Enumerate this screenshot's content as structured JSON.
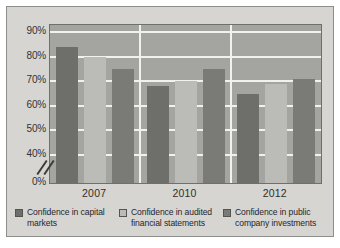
{
  "chart_data": {
    "type": "bar",
    "title": "",
    "xlabel": "",
    "ylabel": "",
    "categories": [
      "2007",
      "2010",
      "2012"
    ],
    "series": [
      {
        "name": "Confidence in capital markets",
        "color": "#6e6e6b",
        "values": [
          84,
          68,
          65
        ]
      },
      {
        "name": "Confidence in audited financial statements",
        "color": "#bbbbb7",
        "values": [
          80,
          70,
          69
        ]
      },
      {
        "name": "Confidence in public company investments",
        "color": "#7a7a77",
        "values": [
          75,
          75,
          71
        ]
      }
    ],
    "ylim": [
      0,
      90
    ],
    "yticks": [
      "0%",
      "40%",
      "50%",
      "60%",
      "70%",
      "80%",
      "90%"
    ],
    "ytick_values": [
      0,
      40,
      50,
      60,
      70,
      80,
      90
    ],
    "axis_break": true,
    "axis_break_between": [
      0,
      40
    ],
    "grid": true,
    "grid_color": "#f2f1ee",
    "legend_position": "bottom",
    "plot_background": "#a4a4a1",
    "figure_background": "#d6d5d1"
  },
  "legend": {
    "items": [
      {
        "label_line1": "Confidence in capital",
        "label_line2": "markets"
      },
      {
        "label_line1": "Confidence in audited",
        "label_line2": "financial statements"
      },
      {
        "label_line1": "Confidence in public",
        "label_line2": "company investments"
      }
    ]
  }
}
